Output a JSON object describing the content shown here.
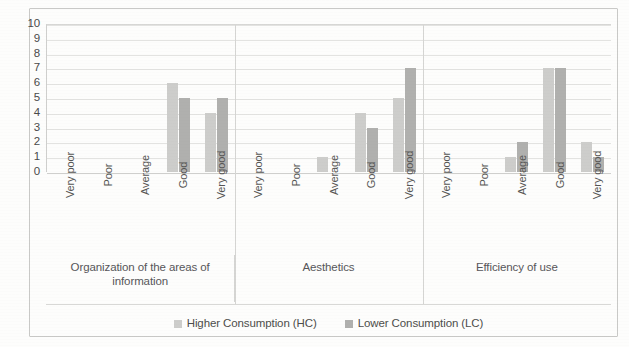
{
  "chart_data": {
    "type": "bar",
    "title": "",
    "xlabel": "",
    "ylabel": "",
    "ylim": [
      0,
      10
    ],
    "yticks": [
      10,
      9,
      8,
      7,
      6,
      5,
      4,
      3,
      2,
      1,
      0
    ],
    "grid": true,
    "legend_position": "bottom",
    "categories": [
      "Very poor",
      "Poor",
      "Average",
      "Good",
      "Very good"
    ],
    "groups": [
      {
        "label": "Organization of the areas of information",
        "series": [
          {
            "name": "Higher Consumption (HC)",
            "values": [
              0,
              0,
              0,
              6,
              4
            ]
          },
          {
            "name": "Lower Consumption (LC)",
            "values": [
              0,
              0,
              0,
              5,
              5
            ]
          }
        ]
      },
      {
        "label": "Aesthetics",
        "series": [
          {
            "name": "Higher Consumption (HC)",
            "values": [
              0,
              0,
              1,
              4,
              5
            ]
          },
          {
            "name": "Lower Consumption (LC)",
            "values": [
              0,
              0,
              0,
              3,
              7
            ]
          }
        ]
      },
      {
        "label": "Efficiency of use",
        "series": [
          {
            "name": "Higher Consumption (HC)",
            "values": [
              0,
              0,
              1,
              7,
              2
            ]
          },
          {
            "name": "Lower Consumption (LC)",
            "values": [
              0,
              0,
              2,
              7,
              1
            ]
          }
        ]
      }
    ],
    "series": [
      {
        "name": "Higher Consumption (HC)",
        "color": "#cdcdcb"
      },
      {
        "name": "Lower Consumption (LC)",
        "color": "#b0b0ae"
      }
    ]
  },
  "legend": {
    "items": [
      {
        "label": "Higher Consumption (HC)",
        "color": "#cdcdcb"
      },
      {
        "label": "Lower Consumption (LC)",
        "color": "#b0b0ae"
      }
    ]
  },
  "axis": {
    "y_labels": [
      "10",
      "9",
      "8",
      "7",
      "6",
      "5",
      "4",
      "3",
      "2",
      "1",
      "0"
    ]
  }
}
